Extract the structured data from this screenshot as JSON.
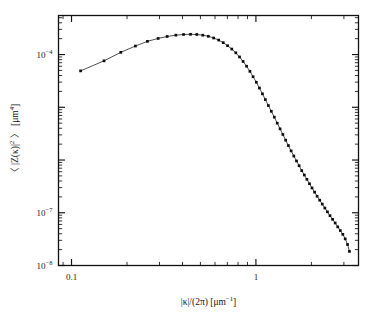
{
  "chart_data": {
    "type": "line",
    "title": "",
    "subtitle": "",
    "xlabel": "|κ|/(2π) [μm⁻¹]",
    "ylabel": "〈 |Z(κ)|² 〉 [μm⁴]",
    "xscale": "log",
    "yscale": "log",
    "xlim": [
      0.085,
      3.6
    ],
    "ylim": [
      1e-08,
      0.00055
    ],
    "grid": false,
    "legend": null,
    "legend_position": "none",
    "marker": "filled-square",
    "xtick_labels": [
      "0.1",
      "1"
    ],
    "xtick_values": [
      0.1,
      1
    ],
    "ytick_labels": [
      "10⁻⁴",
      "10⁻⁷",
      "10⁻⁸"
    ],
    "ytick_values": [
      0.0001,
      1e-07,
      1e-08
    ],
    "series": [
      {
        "name": "spectral density",
        "x": [
          0.112,
          0.15,
          0.185,
          0.222,
          0.258,
          0.295,
          0.33,
          0.368,
          0.405,
          0.442,
          0.478,
          0.515,
          0.552,
          0.59,
          0.628,
          0.665,
          0.702,
          0.74,
          0.778,
          0.815,
          0.852,
          0.89,
          0.928,
          0.965,
          1.005,
          1.045,
          1.085,
          1.125,
          1.168,
          1.212,
          1.258,
          1.305,
          1.352,
          1.4,
          1.45,
          1.5,
          1.552,
          1.605,
          1.66,
          1.715,
          1.772,
          1.83,
          1.89,
          1.952,
          2.015,
          2.08,
          2.148,
          2.218,
          2.29,
          2.365,
          2.442,
          2.522,
          2.605,
          2.69,
          2.778,
          2.868,
          2.96,
          3.05,
          3.14,
          3.215
        ],
        "y": [
          4.9e-05,
          7.6e-05,
          0.00011,
          0.000145,
          0.000178,
          0.000202,
          0.00022,
          0.000233,
          0.00024,
          0.000242,
          0.00024,
          0.000233,
          0.000222,
          0.000206,
          0.000188,
          0.000168,
          0.000147,
          0.000127,
          0.000108,
          9e-05,
          7.4e-05,
          6e-05,
          4.8e-05,
          3.8e-05,
          2.98e-05,
          2.32e-05,
          1.8e-05,
          1.4e-05,
          1.08e-05,
          8.4e-06,
          6.5e-06,
          5e-06,
          3.9e-06,
          3.05e-06,
          2.38e-06,
          1.88e-06,
          1.49e-06,
          1.19e-06,
          9.6e-07,
          7.8e-07,
          6.3e-07,
          5.2e-07,
          4.3e-07,
          3.55e-07,
          2.95e-07,
          2.46e-07,
          2.06e-07,
          1.73e-07,
          1.46e-07,
          1.23e-07,
          1.04e-07,
          8.8e-08,
          7.5e-08,
          6.4e-08,
          5.4e-08,
          4.6e-08,
          3.9e-08,
          3.2e-08,
          2.5e-08,
          1.85e-08
        ]
      }
    ]
  }
}
